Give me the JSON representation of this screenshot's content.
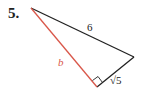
{
  "problem": {
    "number": "5."
  },
  "triangle": {
    "vertices": {
      "top": [
        31,
        8
      ],
      "right": [
        134,
        57
      ],
      "bottom": [
        97,
        87
      ]
    },
    "sides": {
      "hypotenuse": {
        "label": "6",
        "color": "#222222"
      },
      "leg_b": {
        "label": "b",
        "color": "#d9574a"
      },
      "leg_short": {
        "label": "√5",
        "color": "#222222"
      }
    },
    "right_angle_at": "bottom"
  }
}
